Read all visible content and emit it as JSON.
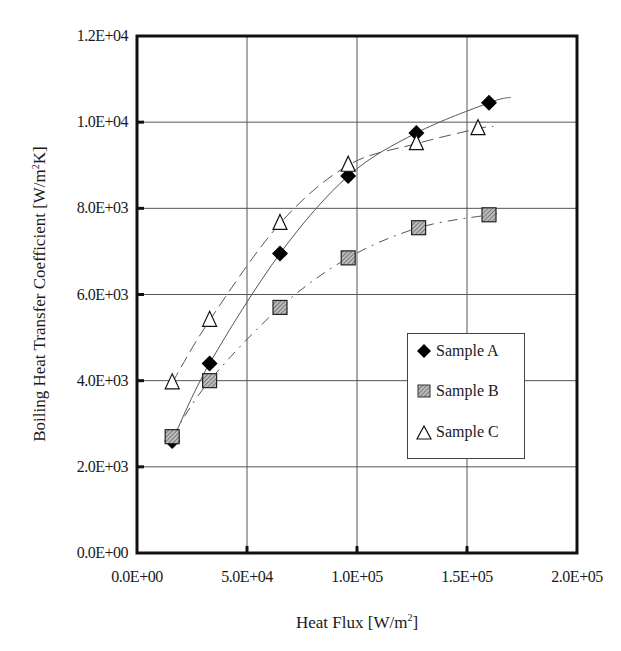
{
  "chart_data": {
    "type": "scatter",
    "title": "",
    "xlabel": "Heat Flux [W/m2]",
    "ylabel": "Boiling Heat Transfer Coefficient [W/m2K]",
    "xlim": [
      0,
      200000
    ],
    "ylim": [
      0,
      12000
    ],
    "x_ticks": [
      "0.0E+00",
      "5.0E+04",
      "1.0E+05",
      "1.5E+05",
      "2.0E+05"
    ],
    "y_ticks": [
      "0.0E+00",
      "2.0E+03",
      "4.0E+03",
      "6.0E+03",
      "8.0E+03",
      "1.0E+04",
      "1.2E+04"
    ],
    "grid": true,
    "legend_position": "inside right, lower-middle",
    "series": [
      {
        "name": "Sample A",
        "marker": "filled-diamond",
        "line": "solid trend",
        "x": [
          16000,
          33000,
          65000,
          96000,
          127000,
          160000
        ],
        "y": [
          2600,
          4400,
          6950,
          8750,
          9750,
          10450
        ]
      },
      {
        "name": "Sample B",
        "marker": "hatched-square",
        "line": "dash-dot trend",
        "x": [
          16000,
          33000,
          65000,
          96000,
          128000,
          160000
        ],
        "y": [
          2700,
          4000,
          5700,
          6850,
          7550,
          7850
        ]
      },
      {
        "name": "Sample C",
        "marker": "open-triangle",
        "line": "dashed trend",
        "x": [
          16000,
          33000,
          65000,
          96000,
          127000,
          155000
        ],
        "y": [
          3950,
          5400,
          7650,
          9000,
          9500,
          9850
        ]
      }
    ]
  },
  "axes": {
    "x_label_main": "Heat Flux [W/m",
    "x_label_sup": "2",
    "x_label_end": "]",
    "y_label_main": "Boiling Heat Transfer Coefficient [W/m",
    "y_label_sup": "2",
    "y_label_end": "K]"
  },
  "legend": {
    "items": [
      {
        "label": "Sample A"
      },
      {
        "label": "Sample B"
      },
      {
        "label": "Sample C"
      }
    ]
  }
}
